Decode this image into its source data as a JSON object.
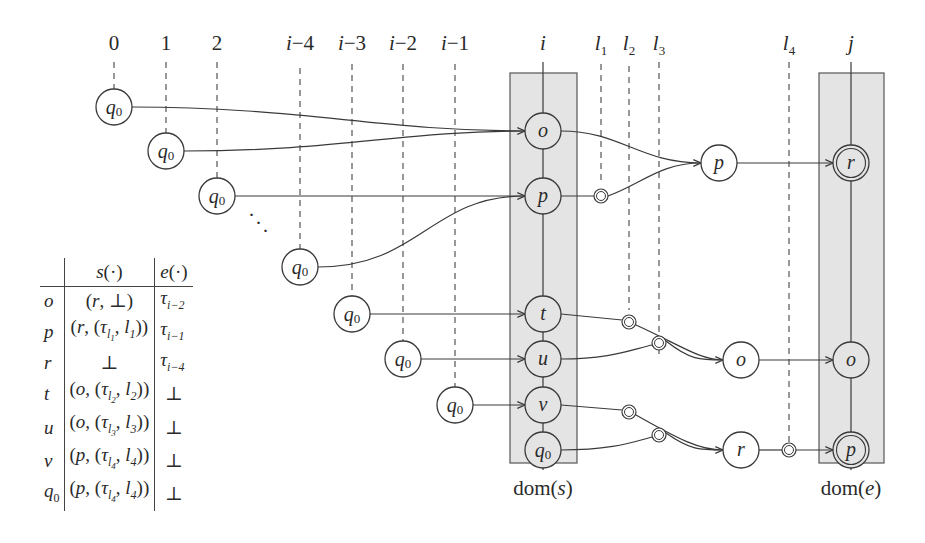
{
  "columns": {
    "labels": [
      "0",
      "1",
      "2",
      "i−4",
      "i−3",
      "i−2",
      "i−1",
      "i",
      "l1",
      "l2",
      "l3",
      "l4",
      "j"
    ]
  },
  "boxes": {
    "dom_s": "dom(s)",
    "dom_e": "dom(e)"
  },
  "nodes": {
    "initial_states": [
      "q0",
      "q0",
      "q0",
      "q0",
      "q0",
      "q0",
      "q0"
    ],
    "ellipsis": "⋱",
    "dom_s": [
      "o",
      "p",
      "t",
      "u",
      "v",
      "q0"
    ],
    "middle": [
      "p",
      "o",
      "r"
    ],
    "dom_e": [
      "r",
      "o",
      "p"
    ],
    "accepting_in_dom_e": [
      "r",
      "p"
    ]
  },
  "table": {
    "headers": [
      "",
      "s(·)",
      "e(·)"
    ],
    "rows": [
      {
        "state": "o",
        "s": "(r, ⊥)",
        "e": "τ_{i−2}"
      },
      {
        "state": "p",
        "s": "(r, (τ_{l1}, l1))",
        "e": "τ_{i−1}"
      },
      {
        "state": "r",
        "s": "⊥",
        "e": "τ_{i−4}"
      },
      {
        "state": "t",
        "s": "(o, (τ_{l2}, l2))",
        "e": "⊥"
      },
      {
        "state": "u",
        "s": "(o, (τ_{l3}, l3))",
        "e": "⊥"
      },
      {
        "state": "v",
        "s": "(p, (τ_{l4}, l4))",
        "e": "⊥"
      },
      {
        "state": "q0",
        "s": "(p, (τ_{l4}, l4))",
        "e": "⊥"
      }
    ]
  },
  "colors": {
    "stroke": "#3a3a3a",
    "box_fill": "#e4e4e4",
    "background": "#ffffff"
  }
}
